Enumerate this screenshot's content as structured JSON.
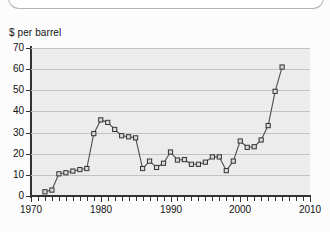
{
  "page": {
    "background_color": "#fcfcfc",
    "top_container_visible": true
  },
  "chart_data": {
    "type": "line",
    "title": "",
    "subtitle": "",
    "xlabel": "",
    "ylabel": "$ per barrel",
    "axis_title_text": "$ per barrel",
    "xlim": [
      1970,
      2010
    ],
    "ylim": [
      0,
      70
    ],
    "xticks": [
      1970,
      1980,
      1990,
      2000,
      2010
    ],
    "xtick_labels": [
      "1970",
      "1980",
      "1990",
      "2000",
      "2010"
    ],
    "x_minor_tick_step": 1,
    "yticks": [
      0,
      10,
      20,
      30,
      40,
      50,
      60,
      70
    ],
    "ytick_labels": [
      "0",
      "10",
      "20",
      "30",
      "40",
      "50",
      "60",
      "70"
    ],
    "grid": "horizontal",
    "legend": "none",
    "marker": "open-square",
    "line_color": "#4d4d4d",
    "marker_face_color": "#d9d9d9",
    "marker_edge_color": "#333333",
    "plot_background_color": "#ececec",
    "gridline_color": "#c3c3c3",
    "axis_color": "#333333",
    "x": [
      1972,
      1973,
      1974,
      1975,
      1976,
      1977,
      1978,
      1979,
      1980,
      1981,
      1982,
      1983,
      1984,
      1985,
      1986,
      1987,
      1988,
      1989,
      1990,
      1991,
      1992,
      1993,
      1994,
      1995,
      1996,
      1997,
      1998,
      1999,
      2000,
      2001,
      2002,
      2003,
      2004,
      2005,
      2006
    ],
    "values": [
      2,
      2.8,
      10.5,
      11,
      11.8,
      12.5,
      13,
      29.5,
      36,
      34.8,
      31.5,
      28.5,
      28,
      27.5,
      13,
      16.5,
      13.5,
      15.5,
      20.8,
      17,
      17.2,
      15,
      15,
      16,
      18.5,
      18.5,
      12,
      16.5,
      26,
      23,
      23.3,
      26.5,
      33.3,
      49.5,
      61
    ],
    "series": [
      {
        "name": "Crude oil price",
        "values": [
          2,
          2.8,
          10.5,
          11,
          11.8,
          12.5,
          13,
          29.5,
          36,
          34.8,
          31.5,
          28.5,
          28,
          27.5,
          13,
          16.5,
          13.5,
          15.5,
          20.8,
          17,
          17.2,
          15,
          15,
          16,
          18.5,
          18.5,
          12,
          16.5,
          26,
          23,
          23.3,
          26.5,
          33.3,
          49.5,
          61
        ]
      }
    ]
  }
}
